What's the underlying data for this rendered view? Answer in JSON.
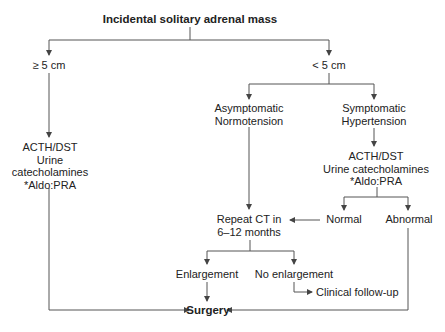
{
  "diagram": {
    "title": "Incidental solitary adrenal mass",
    "nodes": {
      "ge5": "≥ 5 cm",
      "lt5": "< 5 cm",
      "asymptomatic": [
        "Asymptomatic",
        "Normotension"
      ],
      "symptomatic": [
        "Symptomatic",
        "Hypertension"
      ],
      "left_tests": [
        "ACTH/DST",
        "Urine",
        "catecholamines",
        "*Aldo:PRA"
      ],
      "right_tests": [
        "ACTH/DST",
        "Urine catecholamines",
        "*Aldo:PRA"
      ],
      "normal": "Normal",
      "abnormal": "Abnormal",
      "repeat_ct": [
        "Repeat CT in",
        "6–12 months"
      ],
      "enlargement": "Enlargement",
      "no_enlargement": "No enlargement",
      "clinical_followup": "Clinical follow-up",
      "surgery": "Surgery"
    },
    "edges": [
      {
        "from": "title",
        "to": "ge5"
      },
      {
        "from": "title",
        "to": "lt5"
      },
      {
        "from": "ge5",
        "to": "left_tests"
      },
      {
        "from": "left_tests",
        "to": "surgery"
      },
      {
        "from": "lt5",
        "to": "asymptomatic"
      },
      {
        "from": "lt5",
        "to": "symptomatic"
      },
      {
        "from": "asymptomatic",
        "to": "repeat_ct"
      },
      {
        "from": "symptomatic",
        "to": "right_tests"
      },
      {
        "from": "right_tests",
        "to": "normal"
      },
      {
        "from": "right_tests",
        "to": "abnormal"
      },
      {
        "from": "normal",
        "to": "repeat_ct"
      },
      {
        "from": "abnormal",
        "to": "surgery"
      },
      {
        "from": "repeat_ct",
        "to": "enlargement"
      },
      {
        "from": "repeat_ct",
        "to": "no_enlargement"
      },
      {
        "from": "enlargement",
        "to": "surgery"
      },
      {
        "from": "no_enlargement",
        "to": "clinical_followup"
      }
    ],
    "colors": {
      "line": "#555555",
      "text": "#222222",
      "background": "#ffffff"
    }
  }
}
